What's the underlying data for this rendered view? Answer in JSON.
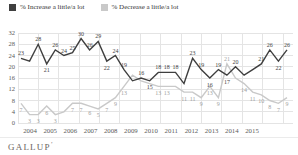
{
  "legend": {
    "increase_label": "% Increase a little/a lot",
    "decrease_label": "% Decrease a little/a lot"
  },
  "branding": {
    "logo": "GALLUP",
    "mark": "’"
  },
  "colors": {
    "increase_line": "#3f3f3f",
    "decrease_line": "#c9c9c9",
    "increase_label_text": "#3f3f3f",
    "decrease_label_text": "#9f9f9f",
    "grid": "#e4e4e4",
    "axis_text": "#5a5a5a",
    "background": "#ffffff"
  },
  "chart_data": {
    "type": "line",
    "title": "",
    "xlabel": "",
    "ylabel": "",
    "grid": true,
    "legend_position": "top-left",
    "x_axis_years": [
      "2004",
      "2005",
      "2006",
      "2007",
      "2008",
      "2009",
      "2010",
      "2011",
      "2012",
      "2013",
      "2014",
      "2015"
    ],
    "y_ticks": [
      0,
      4,
      8,
      12,
      16,
      20,
      24,
      28,
      32
    ],
    "ylim": [
      0,
      32
    ],
    "series": [
      {
        "name": "% Increase a little/a lot",
        "color": "#3f3f3f",
        "label_color": "#3f3f3f",
        "points": [
          {
            "v": 23,
            "l": "23",
            "p": "a"
          },
          {
            "v": 22,
            "l": "",
            "p": "a"
          },
          {
            "v": 28,
            "l": "28",
            "p": "a"
          },
          {
            "v": 21,
            "l": "21",
            "p": "b"
          },
          {
            "v": 26,
            "l": "26",
            "p": "a"
          },
          {
            "v": 24,
            "l": "24",
            "p": "a"
          },
          {
            "v": 25,
            "l": "25",
            "p": "a"
          },
          {
            "v": 30,
            "l": "30",
            "p": "a"
          },
          {
            "v": 26,
            "l": "26",
            "p": "a"
          },
          {
            "v": 29,
            "l": "29",
            "p": "a"
          },
          {
            "v": 22,
            "l": "22",
            "p": "b"
          },
          {
            "v": 24,
            "l": "24",
            "p": "a"
          },
          {
            "v": 19,
            "l": "19",
            "p": "a"
          },
          {
            "v": 15,
            "l": "",
            "p": "b"
          },
          {
            "v": 16,
            "l": "16",
            "p": "a"
          },
          {
            "v": 15,
            "l": "15",
            "p": "b"
          },
          {
            "v": 18,
            "l": "18",
            "p": "a"
          },
          {
            "v": 18,
            "l": "18",
            "p": "a"
          },
          {
            "v": 18,
            "l": "18",
            "p": "a"
          },
          {
            "v": 14,
            "l": "",
            "p": "b"
          },
          {
            "v": 23,
            "l": "23",
            "p": "a"
          },
          {
            "v": 19,
            "l": "19",
            "p": "a"
          },
          {
            "v": 16,
            "l": "16",
            "p": "b"
          },
          {
            "v": 19,
            "l": "19",
            "p": "a"
          },
          {
            "v": 17,
            "l": "17",
            "p": "b"
          },
          {
            "v": 20,
            "l": "20",
            "p": "a"
          },
          {
            "v": 17,
            "l": "",
            "p": "b"
          },
          {
            "v": 19,
            "l": "",
            "p": "a"
          },
          {
            "v": 21,
            "l": "21",
            "p": "a"
          },
          {
            "v": 26,
            "l": "26",
            "p": "a"
          },
          {
            "v": 22,
            "l": "22",
            "p": "b"
          },
          {
            "v": 26,
            "l": "26",
            "p": "a"
          }
        ]
      },
      {
        "name": "% Decrease a little/a lot",
        "color": "#c9c9c9",
        "label_color": "#9f9f9f",
        "points": [
          {
            "v": 7,
            "l": "7",
            "p": "b"
          },
          {
            "v": 3,
            "l": "3",
            "p": "b"
          },
          {
            "v": 3,
            "l": "3",
            "p": "b"
          },
          {
            "v": 6,
            "l": "6",
            "p": "b"
          },
          {
            "v": 3,
            "l": "3",
            "p": "b"
          },
          {
            "v": 4,
            "l": "",
            "p": "b"
          },
          {
            "v": 7,
            "l": "7",
            "p": "b"
          },
          {
            "v": 7,
            "l": "7",
            "p": "b"
          },
          {
            "v": 6,
            "l": "6",
            "p": "b"
          },
          {
            "v": 5,
            "l": "5",
            "p": "b"
          },
          {
            "v": 7,
            "l": "7",
            "p": "b"
          },
          {
            "v": 9,
            "l": "9",
            "p": "b"
          },
          {
            "v": 13,
            "l": "13",
            "p": "b"
          },
          {
            "v": 17,
            "l": "",
            "p": "a"
          },
          {
            "v": 15,
            "l": "",
            "p": "b"
          },
          {
            "v": 14,
            "l": "",
            "p": "b"
          },
          {
            "v": 13,
            "l": "13",
            "p": "b"
          },
          {
            "v": 13,
            "l": "13",
            "p": "b"
          },
          {
            "v": 13,
            "l": "",
            "p": "b"
          },
          {
            "v": 11,
            "l": "11",
            "p": "b"
          },
          {
            "v": 11,
            "l": "11",
            "p": "b"
          },
          {
            "v": 9,
            "l": "9",
            "p": "b"
          },
          {
            "v": 13,
            "l": "13",
            "p": "b"
          },
          {
            "v": 9,
            "l": "9",
            "p": "b"
          },
          {
            "v": 21,
            "l": "21",
            "p": "a"
          },
          {
            "v": 16,
            "l": "",
            "p": "b"
          },
          {
            "v": 14,
            "l": "14",
            "p": "b"
          },
          {
            "v": 11,
            "l": "11",
            "p": "b"
          },
          {
            "v": 10,
            "l": "10",
            "p": "b"
          },
          {
            "v": 8,
            "l": "8",
            "p": "b"
          },
          {
            "v": 7,
            "l": "7",
            "p": "b"
          },
          {
            "v": 9,
            "l": "9",
            "p": "b"
          }
        ]
      }
    ]
  }
}
